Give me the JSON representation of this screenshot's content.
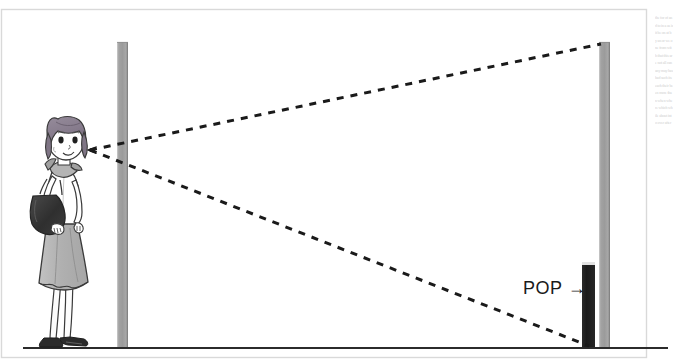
{
  "figure": {
    "caption_label": "POP",
    "arrow_glyph": "→",
    "pop_label_full": "POP →"
  },
  "colors": {
    "background": "#ffffff",
    "frame_border": "#d9d9d9",
    "pillar_fill": "#9a9a9a",
    "pillar_edge_light": "#bdbdbd",
    "pillar_edge_dark": "#7d7d7d",
    "ground_line": "#2b2b2b",
    "dashed_line": "#1a1a1a",
    "pop_display": "#1c1c1c",
    "pop_display_top": "#e2e2e2",
    "label_text": "#1a1a1a",
    "hair": "#8c8291",
    "hair_dark": "#6f6676",
    "skin": "#ffffff",
    "outline": "#2e2e2e",
    "top_white": "#ffffff",
    "skirt": "#b3b3b3",
    "bag": "#3a3a3a",
    "shoe": "#2b2b2b",
    "scarf": "#a9a9a9",
    "edge_margin_text": "#cfcfcf"
  },
  "scene": {
    "frame": {
      "x": 1,
      "y": 9,
      "width": 645,
      "height": 348
    },
    "ground": {
      "label": "ground-line",
      "x1": 23,
      "x2": 668,
      "y": 348,
      "thickness": 2.2
    },
    "pillars": [
      {
        "name": "left-pillar",
        "x": 117,
        "y": 42,
        "width": 11,
        "height": 306
      },
      {
        "name": "right-pillar",
        "x": 599,
        "y": 42,
        "width": 11,
        "height": 306
      }
    ],
    "pop_display": {
      "name": "pop-display-bar",
      "x": 582,
      "y": 262,
      "width": 13,
      "height": 86
    },
    "pop_label": {
      "text": "POP →",
      "x": 523,
      "y": 288,
      "font_size": 18
    },
    "eye_point": {
      "x": 90,
      "y": 150
    },
    "sightlines": [
      {
        "name": "upper-sightline",
        "from_x": 90,
        "from_y": 150,
        "to_x": 601,
        "to_y": 44,
        "dash": "7 7"
      },
      {
        "name": "lower-sightline",
        "from_x": 90,
        "from_y": 150,
        "to_x": 589,
        "to_y": 346,
        "dash": "7 7"
      }
    ],
    "figure_person": {
      "name": "woman-illustration",
      "x": 22,
      "y": 116,
      "width": 80,
      "height": 234,
      "description": "woman standing with handbag looking right"
    }
  },
  "margin_text": "the for of and to in a as is it be on at by an or we one from with that this are not all can any may has had such its each their been more than when where which while about into over after"
}
